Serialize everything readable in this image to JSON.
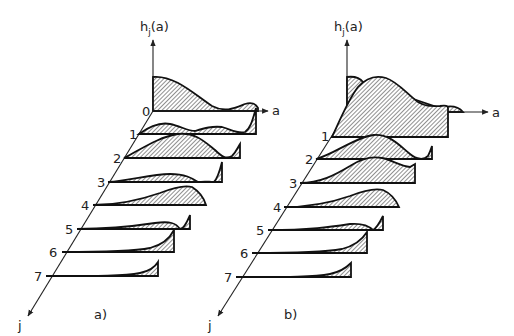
{
  "figure": {
    "panels": [
      {
        "id": "a",
        "caption": "a)",
        "y_axis_label": "h",
        "y_axis_subscript": "j",
        "y_axis_arg": "(a)",
        "x_axis_label": "a",
        "depth_axis_label": "j",
        "row_labels": [
          "0",
          "1",
          "2",
          "3",
          "4",
          "5",
          "6",
          "7"
        ]
      },
      {
        "id": "b",
        "caption": "b)",
        "y_axis_label": "h",
        "y_axis_subscript": "j",
        "y_axis_arg": "(a)",
        "x_axis_label": "a",
        "depth_axis_label": "j",
        "row_labels": [
          "1",
          "2",
          "3",
          "4",
          "5",
          "6",
          "7"
        ]
      }
    ],
    "stroke_color": "#111111",
    "background": "#ffffff"
  }
}
